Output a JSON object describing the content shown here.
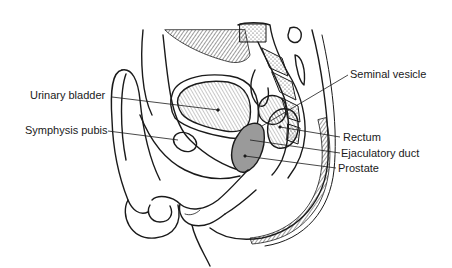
{
  "diagram": {
    "labels": [
      {
        "id": "urinary-bladder",
        "text": "Urinary bladder",
        "x": 30,
        "y": 89
      },
      {
        "id": "symphysis-pubis",
        "text": "Symphysis pubis",
        "x": 25,
        "y": 124
      },
      {
        "id": "seminal-vesicle",
        "text": "Seminal vesicle",
        "x": 350,
        "y": 68
      },
      {
        "id": "rectum",
        "text": "Rectum",
        "x": 343,
        "y": 131
      },
      {
        "id": "ejaculatory-duct",
        "text": "Ejaculatory duct",
        "x": 341,
        "y": 147
      },
      {
        "id": "prostate",
        "text": "Prostate",
        "x": 338,
        "y": 162
      }
    ],
    "colors": {
      "line": "#1a1a1a",
      "shade": "#9a9a9a",
      "background": "#ffffff"
    }
  }
}
